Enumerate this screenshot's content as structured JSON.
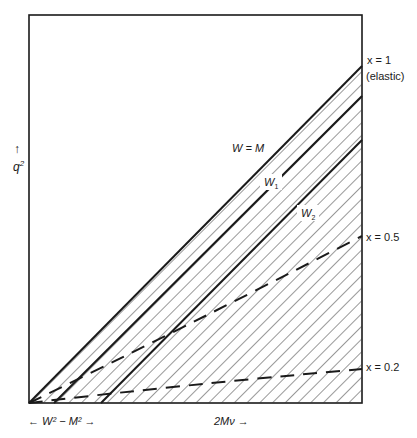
{
  "diagram": {
    "y_axis": {
      "arrow": "↑",
      "label": "q",
      "sup": "2"
    },
    "x_axis_left": {
      "label": "← W² − M² →"
    },
    "x_axis_right": {
      "label": "2Mν →"
    },
    "lines": [
      {
        "id": "w-equals-m",
        "label": "W = M",
        "style": "solid"
      },
      {
        "id": "w1",
        "label": "W",
        "sub": "1",
        "style": "solid"
      },
      {
        "id": "w2",
        "label": "W",
        "sub": "2",
        "style": "solid"
      },
      {
        "id": "x-half",
        "label": "x = 0.5",
        "style": "dashed"
      },
      {
        "id": "x-fifth",
        "label": "x = 0.2",
        "style": "dashed"
      }
    ],
    "right_labels": {
      "x1": "x = 1",
      "elastic": "(elastic)",
      "x05": "x = 0.5",
      "x02": "x = 0.2"
    },
    "colors": {
      "line": "#1a1a1a",
      "hatch": "#333333",
      "background": "#ffffff"
    }
  }
}
